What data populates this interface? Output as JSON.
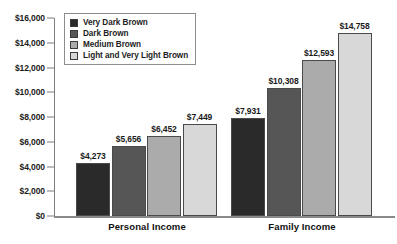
{
  "chart_data": {
    "type": "bar",
    "title": "",
    "subtitle": "",
    "xlabel": "",
    "ylabel": "",
    "categories": [
      "Personal Income",
      "Family Income"
    ],
    "series": [
      {
        "name": "Very Dark Brown",
        "color": "#2a2a2a",
        "values": [
          4273,
          10000
        ]
      },
      {
        "name": "Dark Brown",
        "color": "#565656",
        "values": [
          5656,
          10308
        ]
      },
      {
        "name": "Medium Brown",
        "color": "#ababab",
        "values": [
          6452,
          12593
        ]
      },
      {
        "name": "Light and Very Light Brown",
        "color": "#d8d8d8",
        "values": [
          7449,
          14758
        ]
      }
    ],
    "value_labels": [
      [
        "$4,273",
        "$5,656",
        "$6,452",
        "$7,449"
      ],
      [
        "$7,931",
        "$10,308",
        "$12,593",
        "$14,758"
      ]
    ],
    "values_by_group": [
      [
        4273,
        5656,
        6452,
        7449
      ],
      [
        7931,
        10308,
        12593,
        14758
      ]
    ],
    "ylim": [
      0,
      16000
    ],
    "ytick_values": [
      16000,
      14000,
      12000,
      10000,
      8000,
      6000,
      4000,
      2000,
      0
    ],
    "ytick_labels": [
      "$16,000",
      "$14,000",
      "$12,000",
      "$10,000",
      "$8,000",
      "$6,000",
      "$4,000",
      "$2,000",
      "$0"
    ],
    "grid": false,
    "legend_position": "top-left",
    "legend": [
      "Very Dark Brown",
      "Dark Brown",
      "Medium Brown",
      "Light and Very Light Brown"
    ]
  },
  "axis": {
    "ticks": [
      {
        "label": "$16,000",
        "value": 16000
      },
      {
        "label": "$14,000",
        "value": 14000
      },
      {
        "label": "$12,000",
        "value": 12000
      },
      {
        "label": "$10,000",
        "value": 10000
      },
      {
        "label": "$8,000",
        "value": 8000
      },
      {
        "label": "$6,000",
        "value": 6000
      },
      {
        "label": "$4,000",
        "value": 4000
      },
      {
        "label": "$2,000",
        "value": 2000
      },
      {
        "label": "$0",
        "value": 0
      }
    ]
  },
  "groups": [
    {
      "label": "Personal Income",
      "bars": [
        {
          "series": "Very Dark Brown",
          "label": "$4,273",
          "value": 4273,
          "color": "#2a2a2a"
        },
        {
          "series": "Dark Brown",
          "label": "$5,656",
          "value": 5656,
          "color": "#565656"
        },
        {
          "series": "Medium Brown",
          "label": "$6,452",
          "value": 6452,
          "color": "#ababab"
        },
        {
          "series": "Light and Very Light Brown",
          "label": "$7,449",
          "value": 7449,
          "color": "#d8d8d8"
        }
      ]
    },
    {
      "label": "Family Income",
      "bars": [
        {
          "series": "Very Dark Brown",
          "label": "$7,931",
          "value": 7931,
          "color": "#2a2a2a"
        },
        {
          "series": "Dark Brown",
          "label": "$10,308",
          "value": 10308,
          "color": "#565656"
        },
        {
          "series": "Medium Brown",
          "label": "$12,593",
          "value": 12593,
          "color": "#ababab"
        },
        {
          "series": "Light and Very Light Brown",
          "label": "$14,758",
          "value": 14758,
          "color": "#d8d8d8"
        }
      ]
    }
  ],
  "legend": {
    "items": [
      {
        "label": "Very Dark Brown",
        "color": "#2a2a2a"
      },
      {
        "label": "Dark Brown",
        "color": "#565656"
      },
      {
        "label": "Medium Brown",
        "color": "#ababab"
      },
      {
        "label": "Light and Very Light Brown",
        "color": "#d8d8d8"
      }
    ]
  }
}
